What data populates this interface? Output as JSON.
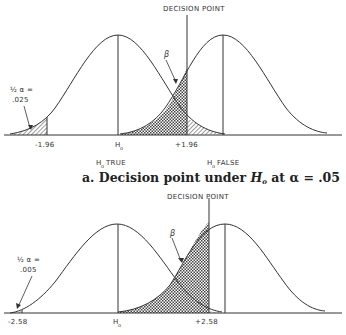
{
  "panel_a": {
    "decision_label": "DECISION POINT",
    "beta_label": "β",
    "alpha_label_line1": "½ α =",
    "alpha_label_line2": ".025",
    "tick_left": "-1.96",
    "tick_center": "H",
    "tick_center_sub": "o",
    "tick_right": "+1.96",
    "h0_true": "H",
    "h0_true_sub": "o",
    "h0_true_word": "TRUE",
    "h0_false": "H",
    "h0_false_sub": "o",
    "h0_false_word": "FALSE",
    "caption_prefix": "a. Decision point under ",
    "caption_h": "H",
    "caption_sub": "o",
    "caption_suffix": " at α = .05"
  },
  "panel_b": {
    "decision_label": "DECISION POINT",
    "beta_label": "β",
    "alpha_label_line1": "½ α =",
    "alpha_label_line2": ".005",
    "tick_left": "-2.58",
    "tick_center": "H",
    "tick_center_sub": "o",
    "tick_right": "+2.58"
  },
  "colors": {
    "ink": "#333333",
    "background": "#ffffff"
  }
}
